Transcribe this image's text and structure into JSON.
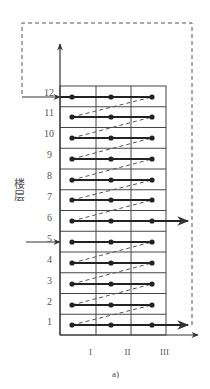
{
  "diagram": {
    "y_axis_label": "楼层",
    "caption": "a)",
    "floors": [
      "1",
      "2",
      "3",
      "4",
      "5",
      "6",
      "7",
      "8",
      "9",
      "10",
      "11",
      "12"
    ],
    "sections": [
      "I",
      "II",
      "III"
    ],
    "grid": {
      "left": 60,
      "right": 166,
      "top": 86,
      "bottom": 335,
      "col_lines": [
        96,
        131
      ]
    },
    "row_dots_y": [
      325,
      305,
      284,
      263,
      242,
      221,
      200,
      180,
      159,
      138,
      117,
      97
    ],
    "dot_x": [
      72,
      111,
      152
    ],
    "floor_label_y": [
      316,
      296,
      275,
      254,
      233,
      212,
      191,
      170,
      149,
      128,
      107,
      87
    ],
    "dashed_links": [
      [
        1,
        2
      ],
      [
        2,
        3
      ],
      [
        3,
        4
      ],
      [
        4,
        5
      ],
      [
        6,
        7
      ],
      [
        7,
        8
      ],
      [
        8,
        9
      ],
      [
        9,
        10
      ],
      [
        10,
        11
      ],
      [
        11,
        12
      ]
    ],
    "flow_arrows": {
      "entry_top_floor": 12,
      "entry_mid_floor": 5,
      "exit_mid_floor": 6,
      "exit_bottom_floor": 1
    },
    "colors": {
      "line": "#222222",
      "grid": "#444444",
      "dash": "#555555",
      "text": "#555555"
    }
  }
}
